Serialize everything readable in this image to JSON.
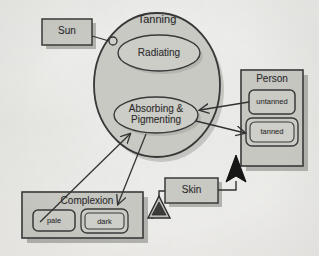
{
  "diagram": {
    "background_color": "#f1f1ee",
    "fill_color": "#c9c9c4",
    "stroke_color": "#3a3a3a",
    "shadow_color": "#9b9b96"
  },
  "nodes": {
    "sun": {
      "label": "Sun",
      "type": "class-box",
      "x": 42,
      "y": 19,
      "w": 50,
      "h": 26
    },
    "tanning": {
      "label": "Tanning",
      "type": "collaboration-circle",
      "cx": 157,
      "cy": 85,
      "rx": 63,
      "ry": 72
    },
    "radiating": {
      "label": "Radiating",
      "type": "ellipse",
      "cx": 159,
      "cy": 53,
      "rx": 41,
      "ry": 18
    },
    "absorbing": {
      "label_line1": "Absorbing &",
      "label_line2": "Pigmenting",
      "type": "ellipse",
      "cx": 156,
      "cy": 115,
      "rx": 42,
      "ry": 18
    },
    "person": {
      "label": "Person",
      "type": "class-box",
      "x": 241,
      "y": 70,
      "w": 62,
      "h": 96
    },
    "untanned": {
      "label": "untanned",
      "type": "state",
      "x": 249,
      "y": 90,
      "w": 46,
      "h": 24,
      "active": false
    },
    "tanned": {
      "label": "tanned",
      "type": "state",
      "x": 246,
      "y": 118,
      "w": 52,
      "h": 28,
      "active": true
    },
    "skin": {
      "label": "Skin",
      "type": "class-box",
      "x": 165,
      "y": 178,
      "w": 53,
      "h": 25
    },
    "complexion": {
      "label": "Complexion",
      "type": "class-box",
      "x": 22,
      "y": 192,
      "w": 121,
      "h": 46
    },
    "pale": {
      "label": "pale",
      "type": "state",
      "x": 33,
      "y": 210,
      "w": 42,
      "h": 21,
      "active": false
    },
    "dark": {
      "label": "dark",
      "type": "state",
      "x": 81,
      "y": 209,
      "w": 47,
      "h": 24,
      "active": true
    }
  },
  "connectors": [
    {
      "name": "sun-to-tanning",
      "kind": "ball-socket",
      "from": "sun",
      "to": "tanning"
    },
    {
      "name": "untanned-to-absorbing",
      "kind": "arrow",
      "from": "untanned",
      "to": "absorbing"
    },
    {
      "name": "absorbing-to-tanned",
      "kind": "arrow",
      "from": "absorbing",
      "to": "tanned"
    },
    {
      "name": "pale-to-absorbing",
      "kind": "arrow",
      "from": "pale",
      "to": "absorbing"
    },
    {
      "name": "absorbing-to-dark",
      "kind": "arrow",
      "from": "absorbing",
      "to": "dark"
    },
    {
      "name": "skin-to-person",
      "kind": "generalization-filled",
      "from": "skin",
      "to": "person"
    },
    {
      "name": "skin-to-complexion",
      "kind": "generalization-hollow",
      "from": "skin",
      "to": "complexion"
    }
  ]
}
